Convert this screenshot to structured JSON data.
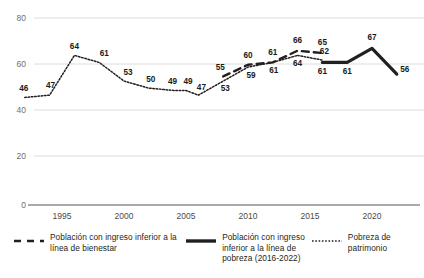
{
  "chart_data": {
    "type": "line",
    "title": "",
    "xlabel": "",
    "ylabel": "",
    "xlim": [
      1992,
      2022
    ],
    "ylim": [
      0,
      80
    ],
    "grid": true,
    "legend_position": "bottom",
    "x_ticks": [
      "1995",
      "2000",
      "2005",
      "2010",
      "2015",
      "2020"
    ],
    "x_tick_values": [
      1995,
      2000,
      2005,
      2010,
      2015,
      2020
    ],
    "y_ticks": [
      "0",
      "20",
      "40",
      "60",
      "80"
    ],
    "y_tick_values": [
      0,
      20,
      40,
      60,
      80
    ],
    "series": [
      {
        "name": "Pobreza de patrimonio",
        "style": "dotted",
        "x": [
          1992,
          1994,
          1996,
          1998,
          2000,
          2002,
          2004,
          2005,
          2006,
          2008,
          2010,
          2012,
          2014
        ],
        "values": [
          46,
          47,
          64,
          61,
          53,
          50,
          49,
          49,
          47,
          53,
          59,
          61,
          64
        ],
        "labels": [
          "46",
          "47",
          "64",
          "61",
          "53",
          "50",
          "49",
          "49",
          "47",
          "53",
          "59",
          "61",
          "64"
        ]
      },
      {
        "name": "Poblacion con ingreso inferior a la linea de bienestar",
        "style": "dashed",
        "x": [
          2008,
          2010,
          2012,
          2014,
          2016
        ],
        "values": [
          55,
          60,
          61,
          66,
          65
        ],
        "labels": [
          "55",
          "60",
          "61",
          "66",
          "65"
        ]
      },
      {
        "name": "Poblacion con ingreso inferior a la linea de pobreza (2016-2022)",
        "style": "solid-bold",
        "x": [
          2016,
          2018,
          2020,
          2022
        ],
        "values": [
          61,
          61,
          67,
          56
        ],
        "labels": [
          "61",
          "61",
          "67",
          "56"
        ]
      },
      {
        "name": "Pobreza de patrimonio (tramo final)",
        "style": "dotted",
        "x": [
          2014,
          2016
        ],
        "values": [
          64,
          62
        ],
        "labels": [
          "62"
        ]
      }
    ]
  },
  "legend": {
    "items": [
      {
        "label": "Población con ingreso inferior a la línea de bienestar",
        "marker": "dashed-line-marker",
        "color": "#231f20"
      },
      {
        "label": "Población con ingreso inferior a la línea de pobreza (2016-2022)",
        "marker": "bold-line-marker",
        "color": "#231f20"
      },
      {
        "label": "Pobreza de patrimonio",
        "marker": "dotted-line-marker",
        "color": "#231f20"
      }
    ]
  },
  "colors": {
    "line": "#231f20",
    "grid": "#d9d9d9",
    "axis": "#8a8a8a",
    "tick_text": "#6f6f6f"
  }
}
